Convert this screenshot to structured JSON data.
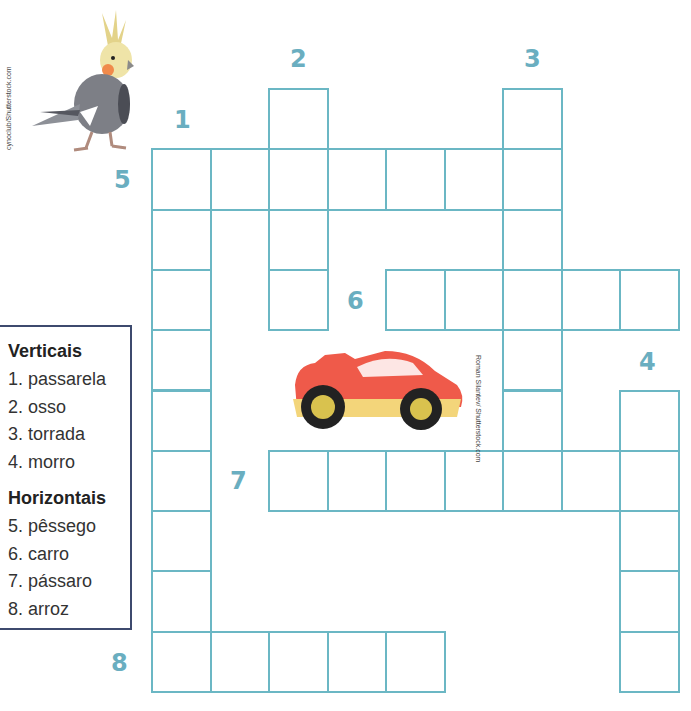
{
  "puzzle": {
    "type": "crossword",
    "grid_color": "#6bb7c4",
    "number_color": "#6aaec0",
    "cell_size": {
      "w": 58.5,
      "h": 60.3
    },
    "origin": {
      "x": 151,
      "y": 88
    },
    "numbers": [
      {
        "n": "1",
        "x": 174,
        "y": 106
      },
      {
        "n": "2",
        "x": 290,
        "y": 45
      },
      {
        "n": "3",
        "x": 524,
        "y": 45
      },
      {
        "n": "4",
        "x": 639,
        "y": 348
      },
      {
        "n": "5",
        "x": 114,
        "y": 166
      },
      {
        "n": "6",
        "x": 347,
        "y": 287
      },
      {
        "n": "7",
        "x": 230,
        "y": 467
      },
      {
        "n": "8",
        "x": 111,
        "y": 649
      }
    ],
    "entries": [
      {
        "num": 5,
        "dir": "across",
        "row": 1,
        "col": 0,
        "len": 7,
        "answer": "pêssego"
      },
      {
        "num": 1,
        "dir": "down",
        "row": 1,
        "col": 0,
        "len": 9,
        "answer": "passarela"
      },
      {
        "num": 2,
        "dir": "down",
        "row": 0,
        "col": 2,
        "len": 4,
        "answer": "osso"
      },
      {
        "num": 3,
        "dir": "down",
        "row": 0,
        "col": 6,
        "len": 7,
        "answer": "torrada"
      },
      {
        "num": 6,
        "dir": "across",
        "row": 3,
        "col": 4,
        "len": 5,
        "answer": "carro"
      },
      {
        "num": 7,
        "dir": "across",
        "row": 6,
        "col": 2,
        "len": 7,
        "answer": "pássaro"
      },
      {
        "num": 4,
        "dir": "down",
        "row": 5,
        "col": 8,
        "len": 5,
        "answer": "morro"
      },
      {
        "num": 8,
        "dir": "across",
        "row": 9,
        "col": 0,
        "len": 5,
        "answer": "arroz"
      }
    ]
  },
  "legend": {
    "verticais_title": "Verticais",
    "verticais": [
      "1. passarela",
      "2. osso",
      "3. torrada",
      "4. morro"
    ],
    "horizontais_title": "Horizontais",
    "horizontais": [
      "5. pêssego",
      "6. carro",
      "7. pássaro",
      "8. arroz"
    ]
  },
  "images": {
    "bird": {
      "name": "cockatiel",
      "credit": "cynoclub/Shutterstock.com"
    },
    "car": {
      "name": "red toy car",
      "credit": "Roman Silantev/ Shutterstock.com"
    }
  }
}
